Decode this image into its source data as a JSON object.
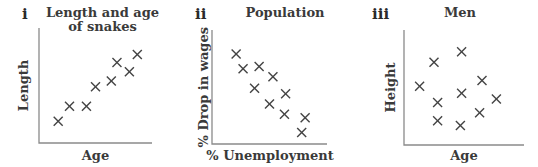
{
  "chart_data": [
    {
      "type": "scatter",
      "panel_label": "i",
      "title": "Length and age of snakes",
      "title_lines": [
        "Length and age",
        "of snakes"
      ],
      "xlabel": "Age",
      "ylabel": "Length",
      "xlim": [
        0,
        10
      ],
      "ylim": [
        0,
        10
      ],
      "grid": false,
      "marker": "x",
      "points": [
        {
          "x": 1.7,
          "y": 1.9
        },
        {
          "x": 2.7,
          "y": 3.2
        },
        {
          "x": 4.2,
          "y": 3.2
        },
        {
          "x": 5.0,
          "y": 4.9
        },
        {
          "x": 6.4,
          "y": 5.4
        },
        {
          "x": 6.9,
          "y": 7.0
        },
        {
          "x": 8.0,
          "y": 6.2
        },
        {
          "x": 8.7,
          "y": 7.7
        }
      ]
    },
    {
      "type": "scatter",
      "panel_label": "ii",
      "title": "Population",
      "title_lines": [
        "Population"
      ],
      "xlabel": "% Unemployment",
      "ylabel": "% Drop in wages",
      "xlim": [
        0,
        10
      ],
      "ylim": [
        0,
        10
      ],
      "grid": false,
      "marker": "x",
      "points": [
        {
          "x": 2.1,
          "y": 7.9
        },
        {
          "x": 2.7,
          "y": 6.6
        },
        {
          "x": 4.1,
          "y": 6.8
        },
        {
          "x": 5.3,
          "y": 5.9
        },
        {
          "x": 3.7,
          "y": 4.9
        },
        {
          "x": 6.4,
          "y": 4.4
        },
        {
          "x": 5.0,
          "y": 3.5
        },
        {
          "x": 6.3,
          "y": 2.6
        },
        {
          "x": 8.1,
          "y": 2.3
        },
        {
          "x": 7.8,
          "y": 1.0
        }
      ]
    },
    {
      "type": "scatter",
      "panel_label": "iii",
      "title": "Men",
      "title_lines": [
        "Men"
      ],
      "xlabel": "Age",
      "ylabel": "Height",
      "xlim": [
        0,
        10
      ],
      "ylim": [
        0,
        10
      ],
      "grid": false,
      "marker": "x",
      "points": [
        {
          "x": 1.3,
          "y": 5.1
        },
        {
          "x": 2.5,
          "y": 7.2
        },
        {
          "x": 4.8,
          "y": 8.1
        },
        {
          "x": 6.5,
          "y": 5.6
        },
        {
          "x": 4.8,
          "y": 4.5
        },
        {
          "x": 2.8,
          "y": 3.7
        },
        {
          "x": 7.7,
          "y": 4.0
        },
        {
          "x": 2.8,
          "y": 2.1
        },
        {
          "x": 6.3,
          "y": 2.8
        },
        {
          "x": 4.7,
          "y": 1.7
        }
      ]
    }
  ],
  "panels": [
    {
      "numeral": "i",
      "title_line1": "Length and age",
      "title_line2": "of snakes",
      "xlabel": "Age",
      "ylabel": "Length"
    },
    {
      "numeral": "ii",
      "title_line1": "Population",
      "title_line2": "",
      "xlabel": "% Unemployment",
      "ylabel": "% Drop in wages"
    },
    {
      "numeral": "iii",
      "title_line1": "Men",
      "title_line2": "",
      "xlabel": "Age",
      "ylabel": "Height"
    }
  ],
  "colors": {
    "axis": "#8a8a8a",
    "marker": "#444444",
    "text": "#3a3a3a"
  }
}
